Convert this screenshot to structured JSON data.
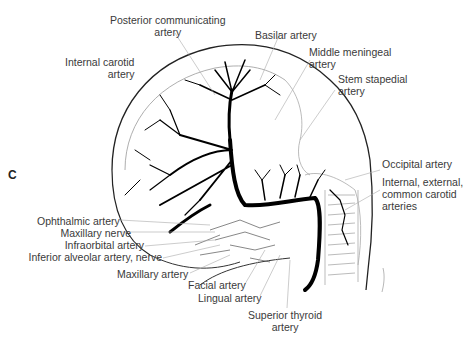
{
  "figure": {
    "panel_letter": "C",
    "labels": {
      "posterior_communicating": [
        "Posterior communicating",
        "artery"
      ],
      "basilar": "Basilar artery",
      "internal_carotid": [
        "Internal carotid",
        "artery"
      ],
      "middle_meningeal": [
        "Middle meningeal",
        "artery"
      ],
      "stem_stapedial": [
        "Stem stapedial",
        "artery"
      ],
      "occipital": "Occipital artery",
      "carotids": [
        "Internal, external,",
        "common carotid",
        "arteries"
      ],
      "ophthalmic": "Ophthalmic artery",
      "maxillary_nerve": "Maxillary nerve",
      "infraorbital": "Infraorbital artery",
      "inferior_alveolar": "Inferior alveolar artery, nerve",
      "maxillary_artery": "Maxillary artery",
      "facial": "Facial artery",
      "lingual": "Lingual artery",
      "superior_thyroid": [
        "Superior thyroid",
        "artery"
      ]
    }
  }
}
